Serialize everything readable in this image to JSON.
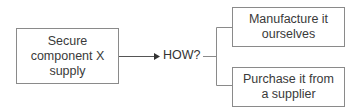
{
  "diagram": {
    "root": {
      "label": "Secure component X supply",
      "lines": [
        "Secure",
        "component X",
        "supply"
      ]
    },
    "connector_label": "HOW?",
    "options": [
      {
        "label": "Manufacture it ourselves",
        "lines": [
          "Manufacture it",
          "ourselves"
        ]
      },
      {
        "label": "Purchase it from a supplier",
        "lines": [
          "Purchase it from",
          "a supplier"
        ]
      }
    ],
    "colors": {
      "line": "#8a8a8a",
      "text": "#333333",
      "background": "#ffffff"
    }
  }
}
